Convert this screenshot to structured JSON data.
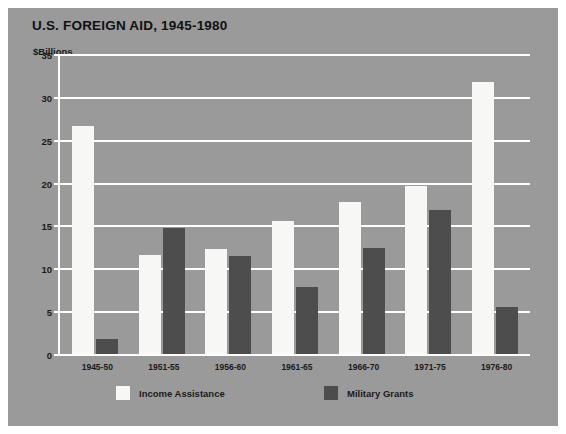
{
  "chart_data": {
    "type": "bar",
    "title": "U.S. FOREIGN AID, 1945-1980",
    "xlabel": "",
    "ylabel": "$Billions",
    "ylim": [
      0,
      35
    ],
    "yticks": [
      0,
      5,
      10,
      15,
      20,
      25,
      30,
      35
    ],
    "ytick_labels": [
      "0",
      "5",
      "10",
      "15",
      "20",
      "25",
      "30",
      "35"
    ],
    "grid": true,
    "legend_position": "bottom",
    "categories": [
      "1945-50",
      "1951-55",
      "1956-60",
      "1961-65",
      "1966-70",
      "1971-75",
      "1976-80"
    ],
    "series": [
      {
        "name": "Income Assistance",
        "color": "#f7f7f5",
        "values": [
          26.6,
          11.5,
          12.2,
          15.5,
          17.7,
          19.6,
          31.7
        ]
      },
      {
        "name": "Military Grants",
        "color": "#4d4d4d",
        "values": [
          1.8,
          14.7,
          11.4,
          7.8,
          12.4,
          16.8,
          5.5
        ]
      }
    ],
    "background_color": "#9a9a9a",
    "axis_color": "#ffffff"
  }
}
